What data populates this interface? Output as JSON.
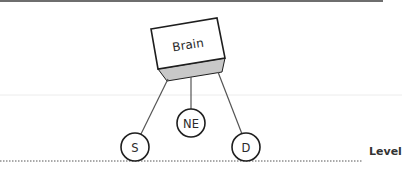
{
  "diagram": {
    "brain": {
      "label": "Brain",
      "fill": "#ffffff",
      "base_fill": "#c8c8c8",
      "stroke": "#1e1e1e"
    },
    "nodes": [
      {
        "id": "S",
        "label": "S"
      },
      {
        "id": "NE",
        "label": "NE"
      },
      {
        "id": "D",
        "label": "D"
      }
    ],
    "edges": [
      {
        "from": "Brain",
        "to": "S"
      },
      {
        "from": "Brain",
        "to": "NE"
      },
      {
        "from": "Brain",
        "to": "D"
      }
    ],
    "level_line": {
      "label": "Level",
      "style": "dotted"
    },
    "colors": {
      "top_rule": "#6e6e6e",
      "line": "#555555",
      "faint_rule": "#e6e6e6"
    }
  }
}
